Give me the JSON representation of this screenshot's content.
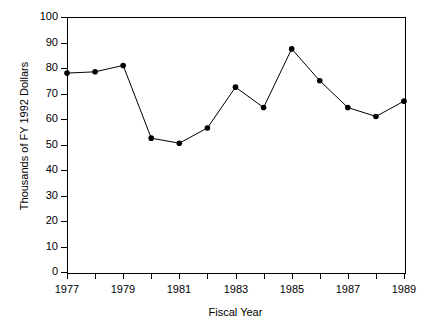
{
  "chart_data": {
    "type": "line",
    "title": "",
    "xlabel": "Fiscal Year",
    "ylabel": "Thousands of FY 1992 Dollars",
    "x": [
      1977,
      1978,
      1979,
      1980,
      1981,
      1982,
      1983,
      1984,
      1985,
      1986,
      1987,
      1988,
      1989
    ],
    "values": [
      78,
      78.5,
      81,
      52.5,
      50.5,
      56.5,
      72.5,
      64.5,
      87.5,
      75,
      64.5,
      61,
      67
    ],
    "xlim": [
      1977,
      1989
    ],
    "ylim": [
      0,
      100
    ],
    "x_tick_values": [
      1977,
      1978,
      1979,
      1980,
      1981,
      1982,
      1983,
      1984,
      1985,
      1986,
      1987,
      1988,
      1989
    ],
    "x_tick_labels": [
      "1977",
      "",
      "1979",
      "",
      "1981",
      "",
      "1983",
      "",
      "1985",
      "",
      "1987",
      "",
      "1989"
    ],
    "y_ticks": [
      0,
      10,
      20,
      30,
      40,
      50,
      60,
      70,
      80,
      90,
      100
    ],
    "y_tick_labels": [
      "0",
      "10",
      "20",
      "30",
      "40",
      "50",
      "60",
      "70",
      "80",
      "90",
      "100"
    ],
    "grid": false,
    "legend": false,
    "marker": "filled-circle",
    "line_color": "#000000",
    "marker_color": "#000000",
    "axis_color": "#000000",
    "background_color": "#ffffff"
  }
}
